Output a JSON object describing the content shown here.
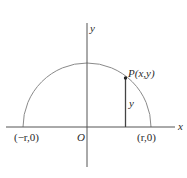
{
  "diagram": {
    "type": "semicircle-coordinate",
    "colors": {
      "axis": "#555555",
      "curve": "#8a8a8a",
      "segment": "#444444",
      "point": "#222222",
      "text": "#2a2a2a"
    },
    "axes": {
      "x_label": "x",
      "y_label": "y",
      "origin_label": "O"
    },
    "points": {
      "left_intercept": "(−r,0)",
      "right_intercept": "(r,0)",
      "P": "P(x,y)"
    },
    "segment_label": "y"
  }
}
